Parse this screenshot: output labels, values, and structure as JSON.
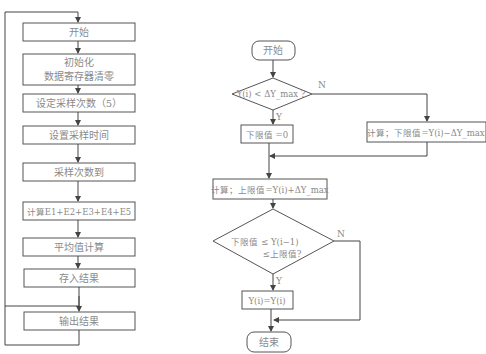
{
  "left_flowchart": {
    "steps": [
      {
        "label": "开始"
      },
      {
        "label_line1": "初始化",
        "label_line2": "数据寄存器清零"
      },
      {
        "label": "设定采样次数（5）"
      },
      {
        "label": "设置采样时间"
      },
      {
        "label": "采样次数到"
      },
      {
        "label": "计算E1+E2+E3+E4+E5"
      },
      {
        "label": "平均值计算"
      },
      {
        "label": "存入结果"
      },
      {
        "label": "输出结果"
      }
    ]
  },
  "right_flowchart": {
    "start": "开始",
    "decision1": "Y(i) < ΔY_max ?",
    "decision1_yes": "Y",
    "decision1_no": "N",
    "lower_zero": "下限值 =0",
    "lower_calc": "计算；下限值=Y(i)−ΔY_max",
    "upper_calc": "计算；上限值=Y(i)+ΔY_max",
    "decision2_line1": "下限值 ≤ Y(i−1)",
    "decision2_line2": "≤上限值?",
    "decision2_yes": "Y",
    "decision2_no": "N",
    "assign": "Y(i)=Y(i)",
    "end": "结束"
  }
}
